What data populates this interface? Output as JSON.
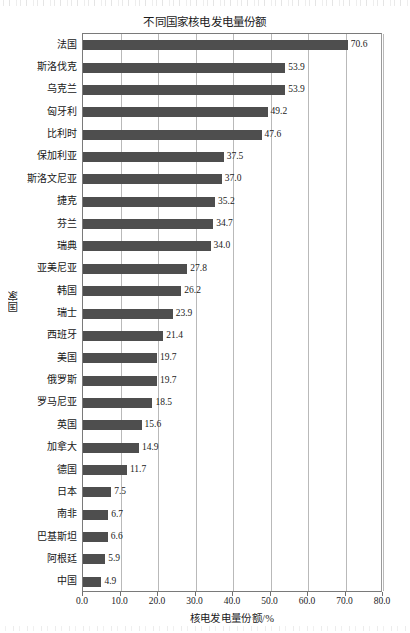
{
  "chart_data": {
    "type": "bar",
    "orientation": "horizontal",
    "title": "不同国家核电发电量份额",
    "xlabel": "核电发电量份额/%",
    "ylabel": "国家",
    "xlim": [
      0.0,
      80.0
    ],
    "xticks": [
      "0.0",
      "10.0",
      "20.0",
      "30.0",
      "40.0",
      "50.0",
      "60.0",
      "70.0",
      "80.0"
    ],
    "xtick_values": [
      0,
      10,
      20,
      30,
      40,
      50,
      60,
      70,
      80
    ],
    "grid": "vertical",
    "legend": "none",
    "bar_color": "#4e4e4e",
    "categories": [
      "法国",
      "斯洛伐克",
      "乌克兰",
      "匈牙利",
      "比利时",
      "保加利亚",
      "斯洛文尼亚",
      "捷克",
      "芬兰",
      "瑞典",
      "亚美尼亚",
      "韩国",
      "瑞士",
      "西班牙",
      "美国",
      "俄罗斯",
      "罗马尼亚",
      "英国",
      "加拿大",
      "德国",
      "日本",
      "南非",
      "巴基斯坦",
      "阿根廷",
      "中国"
    ],
    "values": [
      70.6,
      53.9,
      53.9,
      49.2,
      47.6,
      37.5,
      37.0,
      35.2,
      34.7,
      34.0,
      27.8,
      26.2,
      23.9,
      21.4,
      19.7,
      19.7,
      18.5,
      15.6,
      14.9,
      11.7,
      7.5,
      6.7,
      6.6,
      5.9,
      4.9
    ],
    "data_labels": [
      "70.6",
      "53.9",
      "53.9",
      "49.2",
      "47.6",
      "37.5",
      "37.0",
      "35.2",
      "34.7",
      "34.0",
      "27.8",
      "26.2",
      "23.9",
      "21.4",
      "19.7",
      "19.7",
      "18.5",
      "15.6",
      "14.9",
      "11.7",
      "7.5",
      "6.7",
      "6.6",
      "5.9",
      "4.9"
    ]
  }
}
